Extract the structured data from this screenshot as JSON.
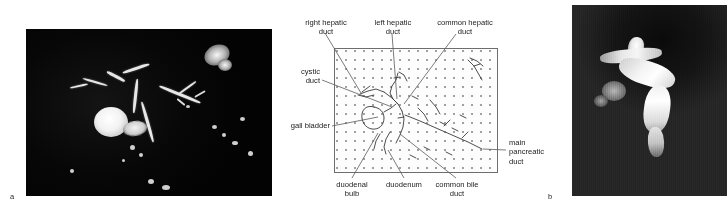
{
  "figure": {
    "panel_a": {
      "letter": "a",
      "kind": "cholangiogram-dark-image"
    },
    "panel_b": {
      "letter": "b",
      "kind": "mri-grayscale-image"
    },
    "diagram": {
      "labels": {
        "right_hepatic_duct": "right hepatic\nduct",
        "right_hepatic_duct_l1": "right hepatic",
        "right_hepatic_duct_l2": "duct",
        "left_hepatic_duct_l1": "left hepatic",
        "left_hepatic_duct_l2": "duct",
        "common_hepatic_duct_l1": "common hepatic",
        "common_hepatic_duct_l2": "duct",
        "cystic_duct_l1": "cystic",
        "cystic_duct_l2": "duct",
        "gall_bladder": "gall bladder",
        "main_pancreatic_duct_l1": "main",
        "main_pancreatic_duct_l2": "pancreatic",
        "main_pancreatic_duct_l3": "duct",
        "duodenal_bulb_l1": "duodenal",
        "duodenal_bulb_l2": "bulb",
        "duodenum": "duodenum",
        "common_bile_duct_l1": "common bile",
        "common_bile_duct_l2": "duct"
      }
    }
  },
  "colors": {
    "line": "#6e6e6e",
    "text": "#1b1b1b",
    "stipple": "#9a9a9a",
    "panel_a_bg": "#060606",
    "panel_b_bg": "#2e2e2e"
  }
}
